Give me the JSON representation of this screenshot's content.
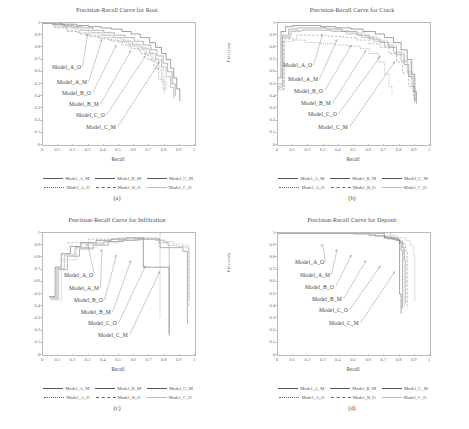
{
  "figure": {
    "caption": ""
  },
  "axes": {
    "xlabel": "Recall",
    "ylabel": "Precision",
    "xticks": [
      "0",
      "0.1",
      "0.2",
      "0.3",
      "0.4",
      "0.5",
      "0.6",
      "0.7",
      "0.8",
      "0.9",
      "1"
    ],
    "yticks": [
      "0",
      "0.1",
      "0.2",
      "0.3",
      "0.4",
      "0.5",
      "0.6",
      "0.7",
      "0.8",
      "0.9",
      "1"
    ],
    "xlim": [
      0,
      1
    ],
    "ylim": [
      0,
      1
    ],
    "grid": false
  },
  "legend": {
    "position": "below-axes",
    "row1": [
      {
        "label": "Model_A_M",
        "style": "solid"
      },
      {
        "label": "Model_B_M",
        "style": "solid"
      },
      {
        "label": "Model_C_M",
        "style": "solid"
      }
    ],
    "row2": [
      {
        "label": "Model_A_O",
        "style": "dotted"
      },
      {
        "label": "Model_B_O",
        "style": "dashed"
      },
      {
        "label": "Model_C_O",
        "style": "solid-light"
      }
    ]
  },
  "annotation_labels": [
    "Model_A_O",
    "Model_A_M",
    "Model_B_O",
    "Model_B_M",
    "Model_C_O",
    "Model_C_M"
  ],
  "panels": [
    {
      "key": "a",
      "caption": "(a)",
      "title": "Precision-Recall Curve for Root"
    },
    {
      "key": "b",
      "caption": "(b)",
      "title": "Precision-Recall Curve for Crack"
    },
    {
      "key": "c",
      "caption": "(c)",
      "title": "Precision-Recall Curve for Infiltration"
    },
    {
      "key": "d",
      "caption": "(d)",
      "title": "Precision-Recall Curve for Deposit"
    }
  ],
  "chart_data": [
    {
      "type": "line",
      "title": "Precision-Recall Curve for Root",
      "xlabel": "Recall",
      "ylabel": "Precision",
      "xlim": [
        0,
        1
      ],
      "ylim": [
        0,
        1
      ],
      "grid": false,
      "legend": "bottom",
      "series": [
        {
          "name": "Model_A_M",
          "style": "solid",
          "x": [
            0.0,
            0.05,
            0.12,
            0.18,
            0.22,
            0.3,
            0.38,
            0.45,
            0.52,
            0.58,
            0.64,
            0.7,
            0.74,
            0.78,
            0.81,
            0.84,
            0.86,
            0.88,
            0.9
          ],
          "y": [
            1.0,
            1.0,
            0.99,
            0.99,
            0.98,
            0.97,
            0.96,
            0.95,
            0.93,
            0.91,
            0.88,
            0.84,
            0.8,
            0.75,
            0.7,
            0.63,
            0.55,
            0.46,
            0.36
          ]
        },
        {
          "name": "Model_B_M",
          "style": "solid",
          "x": [
            0.0,
            0.06,
            0.14,
            0.2,
            0.26,
            0.33,
            0.4,
            0.47,
            0.54,
            0.6,
            0.66,
            0.71,
            0.75,
            0.79,
            0.82,
            0.85,
            0.87
          ],
          "y": [
            1.0,
            0.99,
            0.98,
            0.97,
            0.96,
            0.94,
            0.92,
            0.9,
            0.88,
            0.85,
            0.82,
            0.78,
            0.73,
            0.67,
            0.6,
            0.5,
            0.4
          ]
        },
        {
          "name": "Model_C_M",
          "style": "solid",
          "x": [
            0.0,
            0.06,
            0.13,
            0.19,
            0.25,
            0.32,
            0.39,
            0.46,
            0.53,
            0.59,
            0.65,
            0.7,
            0.74,
            0.78,
            0.81,
            0.84,
            0.86
          ],
          "y": [
            1.0,
            0.99,
            0.97,
            0.96,
            0.94,
            0.92,
            0.9,
            0.88,
            0.85,
            0.82,
            0.79,
            0.75,
            0.7,
            0.64,
            0.56,
            0.47,
            0.38
          ]
        },
        {
          "name": "Model_A_O",
          "style": "dotted",
          "x": [
            0.0,
            0.07,
            0.15,
            0.22,
            0.29,
            0.36,
            0.43,
            0.5,
            0.56,
            0.62,
            0.67,
            0.71,
            0.75,
            0.78,
            0.8
          ],
          "y": [
            1.0,
            0.97,
            0.94,
            0.92,
            0.9,
            0.88,
            0.86,
            0.84,
            0.81,
            0.78,
            0.74,
            0.69,
            0.62,
            0.52,
            0.42
          ]
        },
        {
          "name": "Model_B_O",
          "style": "dashed",
          "x": [
            0.0,
            0.08,
            0.16,
            0.24,
            0.31,
            0.38,
            0.45,
            0.52,
            0.58,
            0.64,
            0.69,
            0.73,
            0.76,
            0.79
          ],
          "y": [
            1.0,
            0.96,
            0.93,
            0.91,
            0.89,
            0.87,
            0.85,
            0.82,
            0.79,
            0.75,
            0.7,
            0.63,
            0.54,
            0.44
          ]
        },
        {
          "name": "Model_C_O",
          "style": "solid-light",
          "x": [
            0.0,
            0.07,
            0.15,
            0.23,
            0.3,
            0.37,
            0.44,
            0.51,
            0.57,
            0.63,
            0.68,
            0.72,
            0.76,
            0.79,
            0.81
          ],
          "y": [
            1.0,
            0.98,
            0.96,
            0.94,
            0.92,
            0.9,
            0.88,
            0.86,
            0.83,
            0.8,
            0.76,
            0.71,
            0.64,
            0.55,
            0.45
          ]
        }
      ]
    },
    {
      "type": "line",
      "title": "Precision-Recall Curve for Crack",
      "xlabel": "Recall",
      "ylabel": "Precision",
      "xlim": [
        0,
        1
      ],
      "ylim": [
        0,
        1
      ],
      "grid": false,
      "legend": "bottom",
      "series": [
        {
          "name": "Model_A_M",
          "style": "solid",
          "x": [
            0.0,
            0.02,
            0.05,
            0.1,
            0.18,
            0.28,
            0.38,
            0.48,
            0.56,
            0.64,
            0.7,
            0.76,
            0.81,
            0.85,
            0.88,
            0.9,
            0.91
          ],
          "y": [
            0.55,
            0.93,
            0.97,
            0.98,
            0.98,
            0.97,
            0.96,
            0.95,
            0.93,
            0.91,
            0.88,
            0.84,
            0.78,
            0.7,
            0.58,
            0.44,
            0.34
          ]
        },
        {
          "name": "Model_B_M",
          "style": "solid",
          "x": [
            0.0,
            0.03,
            0.07,
            0.13,
            0.22,
            0.32,
            0.42,
            0.52,
            0.6,
            0.67,
            0.73,
            0.78,
            0.83,
            0.86,
            0.89,
            0.9
          ],
          "y": [
            0.5,
            0.9,
            0.95,
            0.96,
            0.96,
            0.95,
            0.93,
            0.9,
            0.87,
            0.84,
            0.8,
            0.74,
            0.66,
            0.56,
            0.44,
            0.35
          ]
        },
        {
          "name": "Model_C_M",
          "style": "solid",
          "x": [
            0.0,
            0.03,
            0.08,
            0.15,
            0.25,
            0.35,
            0.45,
            0.55,
            0.63,
            0.7,
            0.76,
            0.81,
            0.85,
            0.88,
            0.9
          ],
          "y": [
            0.48,
            0.88,
            0.93,
            0.94,
            0.94,
            0.93,
            0.91,
            0.88,
            0.85,
            0.81,
            0.76,
            0.69,
            0.6,
            0.48,
            0.36
          ]
        },
        {
          "name": "Model_A_O",
          "style": "dotted",
          "x": [
            0.0,
            0.04,
            0.1,
            0.18,
            0.28,
            0.38,
            0.46,
            0.54,
            0.6,
            0.66,
            0.7,
            0.73,
            0.75
          ],
          "y": [
            0.45,
            0.85,
            0.86,
            0.84,
            0.83,
            0.82,
            0.81,
            0.79,
            0.75,
            0.68,
            0.58,
            0.48,
            0.42
          ]
        },
        {
          "name": "Model_B_O",
          "style": "dashed",
          "x": [
            0.0,
            0.04,
            0.12,
            0.22,
            0.33,
            0.43,
            0.52,
            0.6,
            0.67,
            0.73,
            0.78,
            0.82,
            0.86,
            0.89
          ],
          "y": [
            0.46,
            0.87,
            0.9,
            0.9,
            0.89,
            0.88,
            0.86,
            0.83,
            0.8,
            0.75,
            0.68,
            0.59,
            0.48,
            0.37
          ]
        },
        {
          "name": "Model_C_O",
          "style": "solid-light",
          "x": [
            0.0,
            0.03,
            0.09,
            0.17,
            0.27,
            0.37,
            0.47,
            0.57,
            0.65,
            0.72,
            0.78,
            0.83,
            0.87,
            0.9
          ],
          "y": [
            0.47,
            0.89,
            0.94,
            0.95,
            0.95,
            0.94,
            0.92,
            0.89,
            0.86,
            0.82,
            0.76,
            0.68,
            0.56,
            0.38
          ]
        }
      ]
    },
    {
      "type": "line",
      "title": "Precision-Recall Curve for Infiltration",
      "xlabel": "Recall",
      "ylabel": "Precision",
      "xlim": [
        0,
        1
      ],
      "ylim": [
        0,
        1
      ],
      "grid": false,
      "legend": "bottom",
      "series": [
        {
          "name": "Model_A_M",
          "style": "solid",
          "x": [
            0.04,
            0.08,
            0.12,
            0.18,
            0.25,
            0.35,
            0.45,
            0.55,
            0.64,
            0.66,
            0.66,
            0.72,
            0.78,
            0.82,
            0.83
          ],
          "y": [
            0.48,
            0.72,
            0.83,
            0.89,
            0.92,
            0.94,
            0.95,
            0.96,
            0.96,
            0.96,
            0.72,
            0.72,
            0.72,
            0.72,
            0.16
          ]
        },
        {
          "name": "Model_B_M",
          "style": "solid",
          "x": [
            0.05,
            0.1,
            0.16,
            0.24,
            0.33,
            0.43,
            0.53,
            0.62,
            0.7,
            0.76,
            0.77,
            0.83,
            0.88,
            0.92,
            0.95
          ],
          "y": [
            0.46,
            0.7,
            0.81,
            0.87,
            0.9,
            0.93,
            0.94,
            0.95,
            0.95,
            0.95,
            0.88,
            0.88,
            0.88,
            0.85,
            0.25
          ]
        },
        {
          "name": "Model_C_M",
          "style": "solid",
          "x": [
            0.04,
            0.09,
            0.14,
            0.21,
            0.3,
            0.4,
            0.5,
            0.6,
            0.68,
            0.74,
            0.8,
            0.83,
            0.83
          ],
          "y": [
            0.47,
            0.71,
            0.82,
            0.88,
            0.91,
            0.93,
            0.94,
            0.95,
            0.95,
            0.94,
            0.92,
            0.9,
            0.18
          ]
        },
        {
          "name": "Model_A_O",
          "style": "dotted",
          "x": [
            0.77,
            0.77,
            0.77,
            0.77,
            0.77
          ],
          "y": [
            1.0,
            0.8,
            0.6,
            0.45,
            0.3
          ]
        },
        {
          "name": "Model_B_O",
          "style": "dashed",
          "x": [
            0.16,
            0.3,
            0.5,
            0.66,
            0.76,
            0.82,
            0.88,
            0.94,
            0.96
          ],
          "y": [
            0.92,
            0.95,
            0.96,
            0.96,
            0.92,
            0.9,
            0.89,
            0.88,
            0.4
          ]
        },
        {
          "name": "Model_C_O",
          "style": "solid-light",
          "x": [
            0.05,
            0.12,
            0.22,
            0.35,
            0.5,
            0.64,
            0.74,
            0.8,
            0.86,
            0.92,
            0.96
          ],
          "y": [
            0.45,
            0.78,
            0.88,
            0.92,
            0.94,
            0.95,
            0.94,
            0.93,
            0.91,
            0.9,
            0.45
          ]
        }
      ]
    },
    {
      "type": "line",
      "title": "Precision-Recall Curve for Deposit",
      "xlabel": "Recall",
      "ylabel": "Precision",
      "xlim": [
        0,
        1
      ],
      "ylim": [
        0,
        1
      ],
      "grid": false,
      "legend": "bottom",
      "series": [
        {
          "name": "Model_A_M",
          "style": "solid",
          "x": [
            0.0,
            0.2,
            0.4,
            0.55,
            0.66,
            0.7,
            0.72,
            0.76,
            0.79,
            0.8,
            0.8,
            0.8,
            0.81
          ],
          "y": [
            1.0,
            1.0,
            1.0,
            1.0,
            1.0,
            0.96,
            0.96,
            0.96,
            0.94,
            0.88,
            0.7,
            0.5,
            0.34
          ]
        },
        {
          "name": "Model_B_M",
          "style": "solid",
          "x": [
            0.0,
            0.25,
            0.45,
            0.6,
            0.7,
            0.75,
            0.78,
            0.8,
            0.81,
            0.82,
            0.82,
            0.82
          ],
          "y": [
            1.0,
            1.0,
            1.0,
            0.98,
            0.96,
            0.95,
            0.94,
            0.92,
            0.86,
            0.72,
            0.55,
            0.38
          ]
        },
        {
          "name": "Model_C_M",
          "style": "solid",
          "x": [
            0.0,
            0.3,
            0.5,
            0.64,
            0.72,
            0.77,
            0.8,
            0.82,
            0.83,
            0.84,
            0.84
          ],
          "y": [
            1.0,
            1.0,
            0.99,
            0.97,
            0.95,
            0.94,
            0.92,
            0.88,
            0.78,
            0.6,
            0.42
          ]
        },
        {
          "name": "Model_A_O",
          "style": "dotted",
          "x": [
            0.62,
            0.7,
            0.76,
            0.8,
            0.82,
            0.83,
            0.83,
            0.83
          ],
          "y": [
            1.0,
            0.97,
            0.95,
            0.93,
            0.88,
            0.74,
            0.56,
            0.4
          ]
        },
        {
          "name": "Model_B_O",
          "style": "dashed",
          "x": [
            0.66,
            0.74,
            0.79,
            0.82,
            0.84,
            0.85,
            0.85,
            0.85
          ],
          "y": [
            1.0,
            0.96,
            0.94,
            0.91,
            0.85,
            0.7,
            0.52,
            0.38
          ]
        },
        {
          "name": "Model_C_O",
          "style": "solid-light",
          "x": [
            0.58,
            0.7,
            0.78,
            0.84,
            0.87,
            0.89,
            0.9,
            0.9,
            0.9
          ],
          "y": [
            1.0,
            0.98,
            0.96,
            0.94,
            0.9,
            0.82,
            0.68,
            0.54,
            0.44
          ]
        }
      ]
    }
  ]
}
